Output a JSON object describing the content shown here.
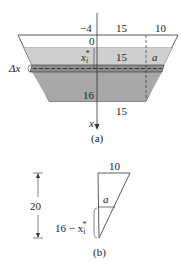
{
  "figure_a": {
    "caption": "(a)",
    "top_labels": {
      "left": "−4",
      "mid": "15",
      "right": "10"
    },
    "zero_label": "0",
    "xi_star_label": "x",
    "xi_star_sub": "i",
    "xi_star_sup": "*",
    "mid_width_label": "15",
    "a_label": "a",
    "delta_x_label": "Δx",
    "depth_label": "16",
    "bottom_width_label": "15",
    "axis_label": "x"
  },
  "figure_b": {
    "caption": "(b)",
    "top_label": "10",
    "height_label": "20",
    "a_label": "a",
    "lower_label_prefix": "16 − x",
    "lower_label_sub": "i",
    "lower_label_sup": "*"
  },
  "colors": {
    "water_light": "#c9c9c9",
    "water_dark": "#a9a9a9",
    "strip": "#8c8c8c",
    "line": "#333333"
  }
}
